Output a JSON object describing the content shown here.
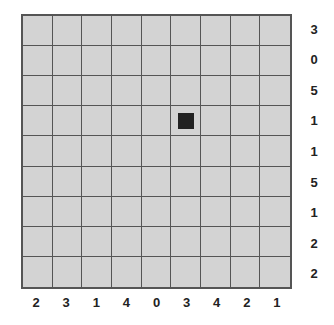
{
  "puzzle": {
    "rows": 9,
    "cols": 9,
    "row_clues": [
      "3",
      "0",
      "5",
      "1",
      "1",
      "5",
      "1",
      "2",
      "2"
    ],
    "col_clues": [
      "2",
      "3",
      "1",
      "4",
      "0",
      "3",
      "4",
      "2",
      "1"
    ],
    "filled_cells": [
      [
        3,
        5
      ]
    ],
    "colors": {
      "cell": "#d3d3d3",
      "grid_line": "#555555",
      "filled": "#222222",
      "clue_text": "#222222"
    }
  }
}
